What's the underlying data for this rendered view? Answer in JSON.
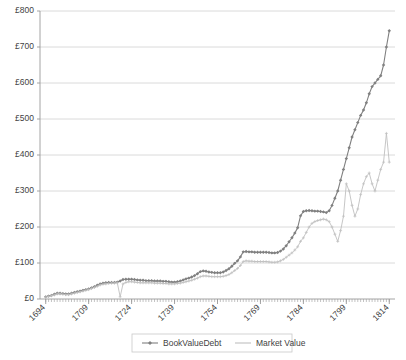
{
  "chart_data": {
    "type": "line",
    "title": "",
    "xlabel": "",
    "ylabel": "",
    "xlim": [
      1692,
      1816
    ],
    "ylim": [
      0,
      800
    ],
    "grid": true,
    "legend_position": "bottom",
    "y_ticks": [
      0,
      100,
      200,
      300,
      400,
      500,
      600,
      700,
      800
    ],
    "y_tick_labels": [
      "£0",
      "£100",
      "£200",
      "£300",
      "£400",
      "£500",
      "£600",
      "£700",
      "£800"
    ],
    "x_ticks": [
      1694,
      1709,
      1724,
      1739,
      1754,
      1769,
      1784,
      1799,
      1814
    ],
    "x_tick_labels": [
      "1694",
      "1709",
      "1724",
      "1739",
      "1754",
      "1769",
      "1784",
      "1799",
      "1814"
    ],
    "x_minor_tick_interval": 1,
    "series": [
      {
        "name": "BookValueDebt",
        "color": "#808080",
        "marker": "diamond",
        "x": [
          1694,
          1695,
          1696,
          1697,
          1698,
          1699,
          1700,
          1701,
          1702,
          1703,
          1704,
          1705,
          1706,
          1707,
          1708,
          1709,
          1710,
          1711,
          1712,
          1713,
          1714,
          1715,
          1716,
          1717,
          1718,
          1719,
          1720,
          1721,
          1722,
          1723,
          1724,
          1725,
          1726,
          1727,
          1728,
          1729,
          1730,
          1731,
          1732,
          1733,
          1734,
          1735,
          1736,
          1737,
          1738,
          1739,
          1740,
          1741,
          1742,
          1743,
          1744,
          1745,
          1746,
          1747,
          1748,
          1749,
          1750,
          1751,
          1752,
          1753,
          1754,
          1755,
          1756,
          1757,
          1758,
          1759,
          1760,
          1761,
          1762,
          1763,
          1764,
          1765,
          1766,
          1767,
          1768,
          1769,
          1770,
          1771,
          1772,
          1773,
          1774,
          1775,
          1776,
          1777,
          1778,
          1779,
          1780,
          1781,
          1782,
          1783,
          1784,
          1785,
          1786,
          1787,
          1788,
          1789,
          1790,
          1791,
          1792,
          1793,
          1794,
          1795,
          1796,
          1797,
          1798,
          1799,
          1800,
          1801,
          1802,
          1803,
          1804,
          1805,
          1806,
          1807,
          1808,
          1809,
          1810,
          1811,
          1812,
          1813,
          1814
        ],
        "values": [
          6,
          8,
          10,
          13,
          16,
          16,
          15,
          14,
          14,
          16,
          18,
          20,
          22,
          24,
          26,
          28,
          31,
          34,
          38,
          42,
          44,
          45,
          46,
          46,
          46,
          47,
          50,
          54,
          55,
          55,
          55,
          54,
          53,
          52,
          52,
          51,
          51,
          51,
          50,
          50,
          50,
          49,
          49,
          48,
          47,
          47,
          48,
          50,
          53,
          56,
          58,
          61,
          65,
          70,
          76,
          78,
          77,
          75,
          74,
          73,
          73,
          73,
          75,
          79,
          84,
          91,
          99,
          106,
          117,
          131,
          132,
          131,
          131,
          130,
          130,
          130,
          130,
          130,
          129,
          128,
          128,
          129,
          133,
          139,
          148,
          159,
          170,
          183,
          198,
          231,
          243,
          245,
          246,
          245,
          244,
          244,
          243,
          242,
          240,
          245,
          260,
          280,
          300,
          330,
          360,
          390,
          420,
          450,
          470,
          490,
          510,
          525,
          545,
          570,
          590,
          600,
          610,
          620,
          650,
          700,
          745
        ]
      },
      {
        "name": "Market Value",
        "color": "#c0c0c0",
        "marker": "plus",
        "x": [
          1694,
          1695,
          1696,
          1697,
          1698,
          1699,
          1700,
          1701,
          1702,
          1703,
          1704,
          1705,
          1706,
          1707,
          1708,
          1709,
          1710,
          1711,
          1712,
          1713,
          1714,
          1715,
          1716,
          1717,
          1718,
          1719,
          1720,
          1721,
          1722,
          1723,
          1724,
          1725,
          1726,
          1727,
          1728,
          1729,
          1730,
          1731,
          1732,
          1733,
          1734,
          1735,
          1736,
          1737,
          1738,
          1739,
          1740,
          1741,
          1742,
          1743,
          1744,
          1745,
          1746,
          1747,
          1748,
          1749,
          1750,
          1751,
          1752,
          1753,
          1754,
          1755,
          1756,
          1757,
          1758,
          1759,
          1760,
          1761,
          1762,
          1763,
          1764,
          1765,
          1766,
          1767,
          1768,
          1769,
          1770,
          1771,
          1772,
          1773,
          1774,
          1775,
          1776,
          1777,
          1778,
          1779,
          1780,
          1781,
          1782,
          1783,
          1784,
          1785,
          1786,
          1787,
          1788,
          1789,
          1790,
          1791,
          1792,
          1793,
          1794,
          1795,
          1796,
          1797,
          1798,
          1799,
          1800,
          1801,
          1802,
          1803,
          1804,
          1805,
          1806,
          1807,
          1808,
          1809,
          1810,
          1811,
          1812,
          1813,
          1814
        ],
        "values": [
          5,
          7,
          9,
          11,
          14,
          14,
          13,
          12,
          12,
          14,
          16,
          18,
          20,
          22,
          24,
          26,
          29,
          32,
          35,
          39,
          41,
          42,
          43,
          44,
          44,
          45,
          6,
          42,
          46,
          48,
          48,
          47,
          46,
          45,
          45,
          45,
          45,
          45,
          44,
          44,
          44,
          43,
          43,
          42,
          42,
          42,
          43,
          44,
          46,
          48,
          50,
          52,
          55,
          58,
          62,
          64,
          64,
          63,
          62,
          62,
          62,
          62,
          63,
          65,
          68,
          73,
          79,
          85,
          93,
          104,
          106,
          105,
          105,
          104,
          104,
          104,
          104,
          104,
          103,
          102,
          102,
          103,
          106,
          110,
          116,
          122,
          128,
          136,
          145,
          160,
          170,
          185,
          200,
          210,
          215,
          218,
          220,
          222,
          220,
          215,
          200,
          180,
          160,
          190,
          230,
          320,
          300,
          260,
          230,
          250,
          290,
          320,
          340,
          350,
          320,
          300,
          330,
          360,
          380,
          460,
          380
        ]
      }
    ]
  },
  "legend": {
    "items": [
      {
        "label": "BookValueDebt",
        "color": "#808080",
        "marker": "diamond"
      },
      {
        "label": "Market Value",
        "color": "#c0c0c0",
        "marker": "line"
      }
    ]
  },
  "colors": {
    "book_value": "#808080",
    "market_value": "#c0c0c0",
    "grid": "#d0d0d0",
    "axis": "#9a9a9a",
    "text": "#3f3f3f",
    "background": "#ffffff"
  }
}
